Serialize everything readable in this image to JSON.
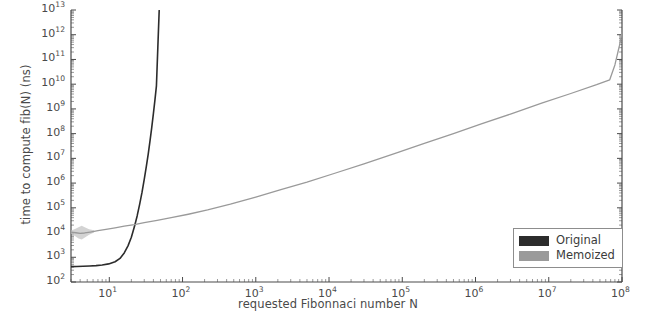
{
  "chart_data": {
    "type": "line",
    "title": "",
    "xlabel": "requested Fibonnaci number N",
    "ylabel": "time to compute fib(N) (ns)",
    "xscale": "log",
    "yscale": "log",
    "xlim": [
      3,
      100000000
    ],
    "ylim": [
      100,
      10000000000000
    ],
    "grid": false,
    "legend_position": "lower right",
    "xticks": [
      10,
      100,
      1000,
      10000,
      100000,
      1000000,
      10000000,
      100000000
    ],
    "xtick_labels": [
      "10¹",
      "10²",
      "10³",
      "10⁴",
      "10⁵",
      "10⁶",
      "10⁷",
      "10⁸"
    ],
    "xtick_mantissas": [
      "10",
      "10",
      "10",
      "10",
      "10",
      "10",
      "10",
      "10"
    ],
    "xtick_exponents": [
      "1",
      "2",
      "3",
      "4",
      "5",
      "6",
      "7",
      "8"
    ],
    "yticks": [
      100,
      1000,
      10000,
      100000,
      1000000,
      10000000,
      100000000,
      1000000000,
      10000000000,
      100000000000,
      1000000000000,
      10000000000000
    ],
    "ytick_mantissas": [
      "10",
      "10",
      "10",
      "10",
      "10",
      "10",
      "10",
      "10",
      "10",
      "10",
      "10",
      "10"
    ],
    "ytick_exponents": [
      "2",
      "3",
      "4",
      "5",
      "6",
      "7",
      "8",
      "9",
      "10",
      "11",
      "12",
      "13"
    ],
    "series": [
      {
        "name": "Original",
        "color": "#2c2c2c",
        "x": [
          3,
          3.6,
          4.4,
          5.4,
          6.6,
          8,
          9.8,
          12,
          14,
          16,
          18,
          20,
          22,
          24,
          26,
          28,
          30,
          32,
          34,
          36,
          38,
          40,
          42,
          44,
          46,
          48
        ],
        "y": [
          420,
          425,
          432,
          442,
          458,
          486,
          540,
          660,
          900,
          1500,
          2900,
          6500,
          17000,
          47000,
          140000,
          430000,
          1400000,
          4600000,
          15000000,
          52000000,
          180000000,
          640000000,
          2300000000,
          8500000000,
          310000000000,
          9500000000000
        ]
      },
      {
        "name": "Memoized",
        "color": "#9a9a9a",
        "x": [
          3,
          3.5,
          4,
          4.6,
          5.5,
          7,
          9,
          12,
          16,
          22,
          30,
          45,
          70,
          120,
          220,
          450,
          1000,
          2200,
          5000,
          12000,
          30000,
          80000,
          200000,
          500000,
          1200000,
          3000000,
          8000000,
          20000000,
          45000000,
          68000000,
          80000000,
          92000000,
          100000000
        ],
        "y": [
          10500,
          9800,
          9200,
          9600,
          10500,
          12000,
          13500,
          15500,
          18000,
          21000,
          25000,
          31000,
          40000,
          55000,
          82000,
          140000,
          270000,
          540000,
          1100000,
          2500000,
          6000000,
          16000000,
          40000000,
          100000000,
          250000000,
          620000000,
          1700000000,
          4200000000,
          9500000000,
          15000000000,
          60000000000,
          350000000000,
          1200000000000
        ]
      }
    ],
    "error_band": {
      "series": "Memoized",
      "color": "#c4c4c4",
      "x": [
        3,
        3.4,
        3.8,
        4.2,
        4.7,
        5.3,
        6.2
      ],
      "y_low": [
        9000,
        7200,
        5800,
        5200,
        6400,
        8200,
        10000
      ],
      "y_high": [
        12200,
        14000,
        16500,
        19000,
        16000,
        13500,
        12500
      ]
    },
    "legend": [
      {
        "label": "Original",
        "color": "#2c2c2c"
      },
      {
        "label": "Memoized",
        "color": "#9a9a9a"
      }
    ]
  },
  "axes_geometry": {
    "plot_left": 71,
    "plot_right": 622,
    "plot_top": 10,
    "plot_bottom": 282
  }
}
